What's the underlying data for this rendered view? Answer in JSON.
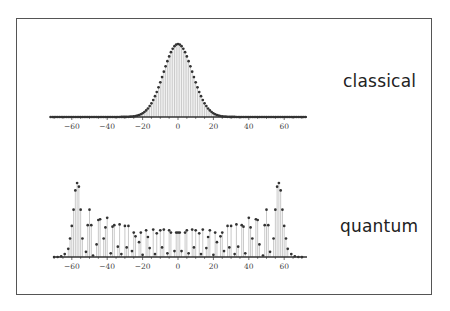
{
  "chart_data": [
    {
      "type": "scatter",
      "title": "classical",
      "xlabel": "",
      "ylabel": "",
      "xlim": [
        -72,
        73
      ],
      "xticks": [
        -60,
        -40,
        -20,
        0,
        20,
        40,
        60
      ],
      "style": "dots with vertical stems (discrete distribution)",
      "description": "Gaussian-shaped classical probability distribution centered at 0, width ~±24",
      "center": 0,
      "sigma": 8.2,
      "peak": 1.0,
      "x_step": 2,
      "x_range": [
        -72,
        72
      ]
    },
    {
      "type": "scatter",
      "title": "quantum",
      "xlabel": "",
      "ylabel": "",
      "xlim": [
        -72,
        73
      ],
      "xticks": [
        -60,
        -40,
        -20,
        0,
        20,
        40,
        60
      ],
      "style": "dots with vertical stems (discrete distribution)",
      "description": "Quantum distribution: oscillating, symmetric, with tall peaks near ±57 and alternating high/low interleaved values across the middle",
      "x": [
        -70,
        -68,
        -66,
        -64,
        -62,
        -61,
        -60,
        -59,
        -58,
        -57,
        -56,
        -55,
        -54,
        -52,
        -51,
        -50,
        -49,
        -48,
        -46,
        -45,
        -44,
        -42,
        -41,
        -40,
        -38,
        -37,
        -36,
        -34,
        -33,
        -32,
        -30,
        -29,
        -28,
        -26,
        -25,
        -24,
        -22,
        -21,
        -20,
        -18,
        -17,
        -16,
        -14,
        -13,
        -12,
        -10,
        -9,
        -8,
        -6,
        -5,
        -4,
        -2,
        -1,
        0,
        1,
        2,
        4,
        5,
        6,
        8,
        9,
        10,
        12,
        13,
        14,
        16,
        17,
        18,
        20,
        21,
        22,
        24,
        25,
        26,
        28,
        29,
        30,
        32,
        33,
        34,
        36,
        37,
        38,
        40,
        41,
        42,
        44,
        45,
        46,
        48,
        49,
        50,
        51,
        52,
        54,
        55,
        56,
        57,
        58,
        59,
        60,
        61,
        62,
        64,
        66,
        68,
        70
      ],
      "values": [
        0.0,
        0.0,
        0.01,
        0.04,
        0.11,
        0.25,
        0.42,
        0.64,
        0.9,
        1.0,
        0.95,
        0.64,
        0.25,
        0.07,
        0.43,
        0.64,
        0.43,
        0.02,
        0.17,
        0.5,
        0.51,
        0.25,
        0.4,
        0.53,
        0.05,
        0.41,
        0.43,
        0.14,
        0.44,
        0.04,
        0.42,
        0.13,
        0.42,
        0.08,
        0.33,
        0.28,
        0.2,
        0.33,
        0.03,
        0.36,
        0.27,
        0.12,
        0.37,
        0.04,
        0.32,
        0.36,
        0.13,
        0.37,
        0.05,
        0.36,
        0.33,
        0.08,
        0.33,
        0.33,
        0.33,
        0.08,
        0.33,
        0.36,
        0.05,
        0.37,
        0.13,
        0.36,
        0.32,
        0.04,
        0.37,
        0.12,
        0.27,
        0.36,
        0.03,
        0.33,
        0.2,
        0.28,
        0.33,
        0.08,
        0.42,
        0.13,
        0.42,
        0.04,
        0.44,
        0.14,
        0.43,
        0.41,
        0.05,
        0.53,
        0.4,
        0.25,
        0.51,
        0.5,
        0.17,
        0.02,
        0.43,
        0.64,
        0.43,
        0.07,
        0.25,
        0.64,
        0.95,
        1.0,
        0.9,
        0.64,
        0.42,
        0.25,
        0.11,
        0.04,
        0.01,
        0.0,
        0.0
      ]
    }
  ],
  "labels": {
    "classical": "classical",
    "quantum": "quantum"
  },
  "colors": {
    "dot": "#333333",
    "stem": "#bbbbbb",
    "axis": "#333333",
    "frame": "#555555",
    "text": "#222222"
  }
}
